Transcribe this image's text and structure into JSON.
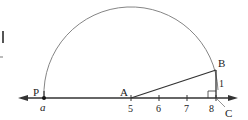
{
  "diagram": {
    "points": {
      "P": {
        "label": "P"
      },
      "A": {
        "label": "A"
      },
      "B": {
        "label": "B"
      },
      "C": {
        "label": "C"
      }
    },
    "point_value_label": "a",
    "tick_labels": [
      "5",
      "6",
      "7",
      "8"
    ],
    "segment_label_BC": "1",
    "colors": {
      "line": "#333333",
      "arc": "#777777",
      "text": "#222222"
    }
  }
}
